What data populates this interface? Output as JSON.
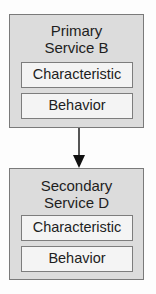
{
  "services": [
    {
      "title_line1": "Primary",
      "title_line2": "Service B",
      "items": [
        {
          "label": "Characteristic"
        },
        {
          "label": "Behavior"
        }
      ]
    },
    {
      "title_line1": "Secondary",
      "title_line2": "Service D",
      "items": [
        {
          "label": "Characteristic"
        },
        {
          "label": "Behavior"
        }
      ]
    }
  ],
  "connector": {
    "from": "Primary Service B",
    "to": "Secondary Service D",
    "type": "arrow"
  }
}
